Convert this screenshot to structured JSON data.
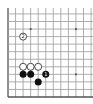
{
  "diagram": {
    "type": "go-board-fragment",
    "region": "bottom-left corner",
    "grid": {
      "origin_x": 8,
      "origin_y": 97,
      "spacing": 7.55,
      "cols_visible": 12,
      "rows_visible": 13,
      "top_y": 8,
      "right_x": 93
    },
    "star_points": [
      {
        "col": 3,
        "row": 3
      },
      {
        "col": 9,
        "row": 3
      },
      {
        "col": 3,
        "row": 9
      },
      {
        "col": 9,
        "row": 9
      }
    ],
    "stones": [
      {
        "color": "white",
        "col": 2,
        "row": 8,
        "label": "2"
      },
      {
        "color": "white",
        "col": 2,
        "row": 4,
        "label": ""
      },
      {
        "color": "white",
        "col": 3,
        "row": 4,
        "label": ""
      },
      {
        "color": "white",
        "col": 4,
        "row": 4,
        "label": ""
      },
      {
        "color": "black",
        "col": 2,
        "row": 3,
        "label": ""
      },
      {
        "color": "black",
        "col": 3,
        "row": 3,
        "label": ""
      },
      {
        "color": "black",
        "col": 5,
        "row": 3,
        "label": "1"
      },
      {
        "color": "black",
        "col": 4,
        "row": 2,
        "label": ""
      }
    ],
    "colors": {
      "background": "#ffffff",
      "grid": "#9a9a9a",
      "edge": "#555555",
      "black_stone": "#111111",
      "white_stone": "#ffffff"
    }
  }
}
